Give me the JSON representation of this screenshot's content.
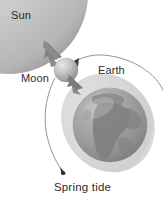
{
  "diagram": {
    "caption": "Spring tide",
    "labels": {
      "sun": "Sun",
      "moon": "Moon",
      "earth": "Earth"
    },
    "bodies": [
      {
        "name": "sun",
        "label": "Sun",
        "shape": "partial-disc",
        "position": "top-left",
        "center_x": 10,
        "center_y": -4,
        "radius": 78,
        "fill": "#c9c9c9",
        "edge_fill": "#8e8e8e"
      },
      {
        "name": "moon",
        "label": "Moon",
        "shape": "sphere",
        "center_x": 66,
        "center_y": 70,
        "radius": 12,
        "fill": "#b5b5b5",
        "highlight": "#e2e2e2"
      },
      {
        "name": "earth",
        "label": "Earth",
        "shape": "sphere-with-continents",
        "center_x": 110,
        "center_y": 125,
        "radius": 38,
        "fill": "#9b9b9b",
        "ocean": "#9a9a9a",
        "land": "#868686"
      }
    ],
    "tidal_bulge": {
      "name": "tidal-bulge-halo",
      "shape": "ellipse",
      "center_x": 108,
      "center_y": 123,
      "rx": 46,
      "ry": 52,
      "rotation_deg": -32,
      "fill": "#d5d5d5"
    },
    "force_arrows": [
      {
        "name": "moon-to-sun-arrow",
        "direction": "up-left",
        "from_x": 66,
        "from_y": 66,
        "to_x": 46,
        "to_y": 44,
        "color": "#7d7d7d"
      },
      {
        "name": "moon-to-earth-arrow",
        "direction": "down-right",
        "from_x": 68,
        "from_y": 78,
        "to_x": 80,
        "to_y": 90,
        "color": "#7d7d7d"
      }
    ],
    "orbit_path": {
      "name": "moon-orbit-path",
      "stroke": "#8a8a8a",
      "stroke_width": 0.9,
      "arrowheads": 2,
      "description": "curve arcing from right of Earth over the Moon and sweeping down-left"
    },
    "colors": {
      "background": "#ffffff",
      "text": "#2b2b2b",
      "sun": "#c9c9c9",
      "moon": "#b5b5b5",
      "earth": "#9b9b9b",
      "bulge": "#d5d5d5",
      "stroke": "#8a8a8a"
    }
  }
}
